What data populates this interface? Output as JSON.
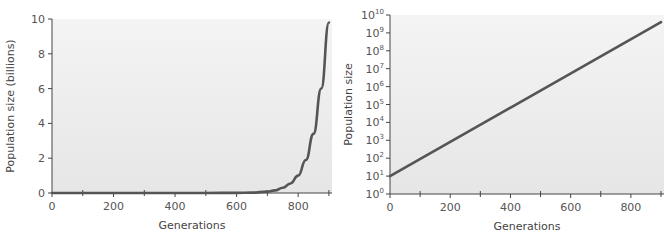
{
  "chart_data": [
    {
      "type": "line",
      "title": "",
      "xlabel": "Generations",
      "ylabel": "Population size (billions)",
      "xlim": [
        0,
        910
      ],
      "ylim": [
        0,
        10
      ],
      "yscale": "linear",
      "xticks": [
        0,
        200,
        400,
        600,
        800
      ],
      "xticks_minor": [
        100,
        300,
        500,
        700,
        900
      ],
      "yticks": [
        0,
        2,
        4,
        6,
        8,
        10
      ],
      "x": [
        0,
        100,
        200,
        300,
        400,
        500,
        600,
        650,
        700,
        725,
        750,
        775,
        800,
        825,
        850,
        875,
        900
      ],
      "series": [
        {
          "name": "Exponential growth",
          "values": [
            0.0,
            0.0,
            0.0,
            0.0,
            0.0,
            0.0,
            0.01,
            0.02,
            0.08,
            0.15,
            0.3,
            0.55,
            1.0,
            1.9,
            3.4,
            6.0,
            9.8
          ]
        }
      ],
      "grid": false,
      "background": "#ececec",
      "line_color": "#555555"
    },
    {
      "type": "line",
      "title": "",
      "xlabel": "Generations",
      "ylabel": "Population size",
      "xlim": [
        0,
        910
      ],
      "ylim_exponent": [
        0,
        10
      ],
      "yscale": "log",
      "xticks": [
        0,
        200,
        400,
        600,
        800
      ],
      "xticks_minor": [
        100,
        300,
        500,
        700,
        900
      ],
      "yticks_exponent": [
        0,
        1,
        2,
        3,
        4,
        5,
        6,
        7,
        8,
        9,
        10
      ],
      "ytick_base": "10",
      "x": [
        0,
        900
      ],
      "series": [
        {
          "name": "Exponential growth (log scale)",
          "log10_values": [
            1.0,
            9.6
          ]
        }
      ],
      "grid": false,
      "background": "#ececec",
      "line_color": "#555555"
    }
  ]
}
